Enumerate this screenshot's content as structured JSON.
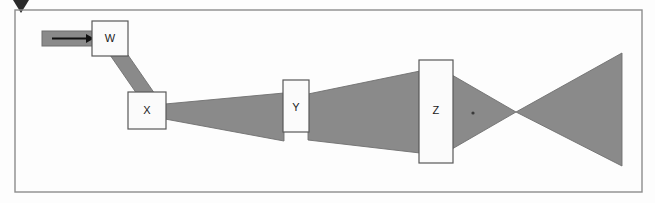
{
  "figure": {
    "kind": "optical-beam-path-diagram",
    "background_color": "#fdfdfd",
    "beam_fill_color": "#8a8a8a",
    "beam_stroke_color": "#6f6f6f",
    "component_fill_color": "#fbfbfb",
    "component_stroke_color": "#595959",
    "frame_stroke_color": "#8c8c8c",
    "marker_color": "#2b2b2b",
    "arrow_color": "#111111"
  },
  "frame": {
    "name": "outer-frame",
    "x": 15,
    "y": 10,
    "width": 627,
    "height": 182
  },
  "top_marker": {
    "name": "top-pointer-marker",
    "points": "13,0 29,0 21,13"
  },
  "input_arrow": {
    "name": "input-beam-arrow",
    "bar": {
      "x": 42,
      "y": 31,
      "width": 52,
      "height": 15
    },
    "shaft": {
      "x1": 52,
      "y1": 38.5,
      "x2": 86,
      "y2": 38.5
    },
    "head": "86,34 94,38.5 86,43"
  },
  "components": [
    {
      "id": "W",
      "label": "W",
      "name": "component-w",
      "x": 92,
      "y": 21,
      "width": 36,
      "height": 35,
      "label_x": 110,
      "label_y": 39
    },
    {
      "id": "X",
      "label": "X",
      "name": "component-x",
      "x": 128,
      "y": 92,
      "width": 38,
      "height": 37,
      "label_x": 147,
      "label_y": 111
    },
    {
      "id": "Y",
      "label": "Y",
      "name": "component-y",
      "x": 283,
      "y": 80,
      "width": 26,
      "height": 52,
      "label_x": 296,
      "label_y": 108
    },
    {
      "id": "Z",
      "label": "Z",
      "name": "component-z",
      "x": 419,
      "y": 60,
      "width": 34,
      "height": 103,
      "label_x": 436,
      "label_y": 111
    }
  ],
  "beams": [
    {
      "name": "beam-w-to-x",
      "segment": "W-X",
      "points": "110,55 128,55 166,110 148,110"
    },
    {
      "name": "beam-x-to-y",
      "segment": "X-Y",
      "points": "165,104 284,93 284,141 165,119"
    },
    {
      "name": "beam-y-to-z",
      "segment": "Y-Z",
      "points": "308,94 420,71 420,153 308,140"
    },
    {
      "name": "beam-z-converging",
      "segment": "Z-focus",
      "points": "452,75 516,112 452,149"
    },
    {
      "name": "beam-diverging-output",
      "segment": "focus-output",
      "points": "516,112 622,53 622,166"
    }
  ],
  "focal_point": {
    "name": "focal-crossover-point",
    "cx": 516,
    "cy": 112
  },
  "axis_dot": {
    "name": "optical-axis-dot",
    "cx": 473,
    "cy": 113,
    "r": 1.6
  }
}
